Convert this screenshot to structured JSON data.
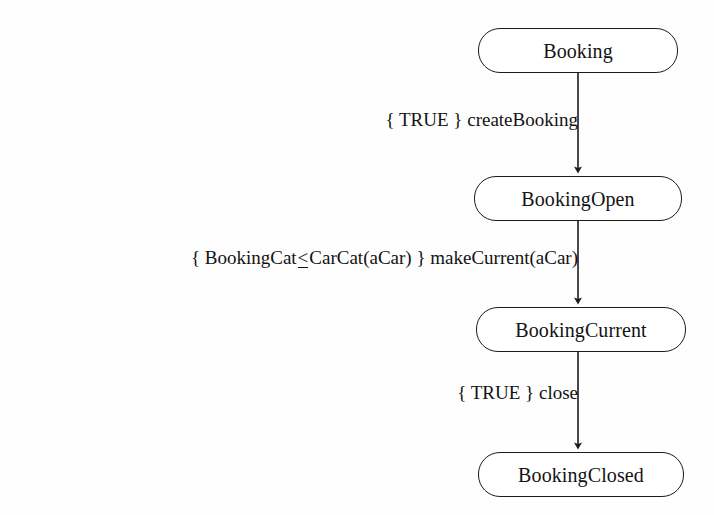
{
  "diagram": {
    "type": "state-transition-diagram",
    "title": "Booking",
    "background_color": "#fefefe",
    "stroke_color": "#1c1c1c",
    "text_color": "#131313",
    "states": [
      {
        "id": "booking",
        "label": "Booking",
        "x": 478,
        "y": 28,
        "width": 200,
        "height": 45
      },
      {
        "id": "bookingopen",
        "label": "BookingOpen",
        "x": 474,
        "y": 176,
        "width": 208,
        "height": 45
      },
      {
        "id": "bookingcurrent",
        "label": "BookingCurrent",
        "x": 476,
        "y": 307,
        "width": 210,
        "height": 45
      },
      {
        "id": "bookingclosed",
        "label": "BookingClosed",
        "x": 478,
        "y": 452,
        "width": 206,
        "height": 45
      }
    ],
    "transitions": [
      {
        "id": "create-booking",
        "from": "Booking",
        "to": "BookingOpen",
        "guard": "{ TRUE }",
        "event": "createBooking",
        "label_prefix": "{ TRUE } ",
        "label_mid": "",
        "label_suffix": "createBooking",
        "has_leq": false,
        "label_right": 578,
        "label_top": 110,
        "arrow": {
          "x": 578,
          "y1": 73,
          "y2": 175
        }
      },
      {
        "id": "make-current",
        "from": "BookingOpen",
        "to": "BookingCurrent",
        "guard": "{ BookingCat≤CarCat(aCar) }",
        "event": "makeCurrent(aCar)",
        "label_prefix": "{ BookingCat",
        "label_mid": "<",
        "label_suffix": "CarCat(aCar) } makeCurrent(aCar)",
        "has_leq": true,
        "label_right": 578,
        "label_top": 248,
        "arrow": {
          "x": 578,
          "y1": 221,
          "y2": 306
        }
      },
      {
        "id": "close",
        "from": "BookingCurrent",
        "to": "BookingClosed",
        "guard": "{ TRUE }",
        "event": "close",
        "label_prefix": "{ TRUE } ",
        "label_mid": "",
        "label_suffix": "close",
        "has_leq": false,
        "label_right": 578,
        "label_top": 383,
        "arrow": {
          "x": 578,
          "y1": 352,
          "y2": 451
        }
      }
    ]
  }
}
